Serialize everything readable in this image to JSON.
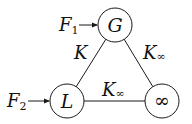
{
  "nodes": [
    {
      "id": "G",
      "label": "G"
    },
    {
      "id": "L",
      "label": "L"
    },
    {
      "id": "inf",
      "label": "∞"
    }
  ],
  "edges": [
    {
      "from": "G",
      "to": "L",
      "label_main": "K",
      "label_sub": ""
    },
    {
      "from": "G",
      "to": "inf",
      "label_main": "K",
      "label_sub": "∞"
    },
    {
      "from": "L",
      "to": "inf",
      "label_main": "K",
      "label_sub": "∞"
    }
  ],
  "inputs": [
    {
      "target": "G",
      "label_main": "F",
      "label_sub": "1"
    },
    {
      "target": "L",
      "label_main": "F",
      "label_sub": "2"
    }
  ],
  "colors": {
    "stroke": "#1a1a1a",
    "text": "#111111",
    "background": "#ffffff"
  }
}
